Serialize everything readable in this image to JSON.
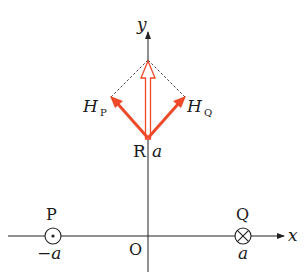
{
  "diagram": {
    "type": "magnetic-field-vector-diagram",
    "axes": {
      "x_label": "x",
      "y_label": "y",
      "origin_label": "O"
    },
    "points": {
      "P": {
        "label": "P",
        "coord_label": "−a",
        "symbol": "current-out-of-page"
      },
      "Q": {
        "label": "Q",
        "coord_label": "a",
        "symbol": "current-into-page"
      },
      "R": {
        "label": "R",
        "coord_label": "a"
      }
    },
    "vectors": {
      "HP": {
        "main": "H",
        "sub": "P"
      },
      "HQ": {
        "main": "H",
        "sub": "Q"
      },
      "resultant": {
        "description": "sum of HP and HQ along +y"
      }
    },
    "colors": {
      "field_vectors": "#ee4a2a",
      "axes": "#222222",
      "dashed": "#333333"
    }
  }
}
